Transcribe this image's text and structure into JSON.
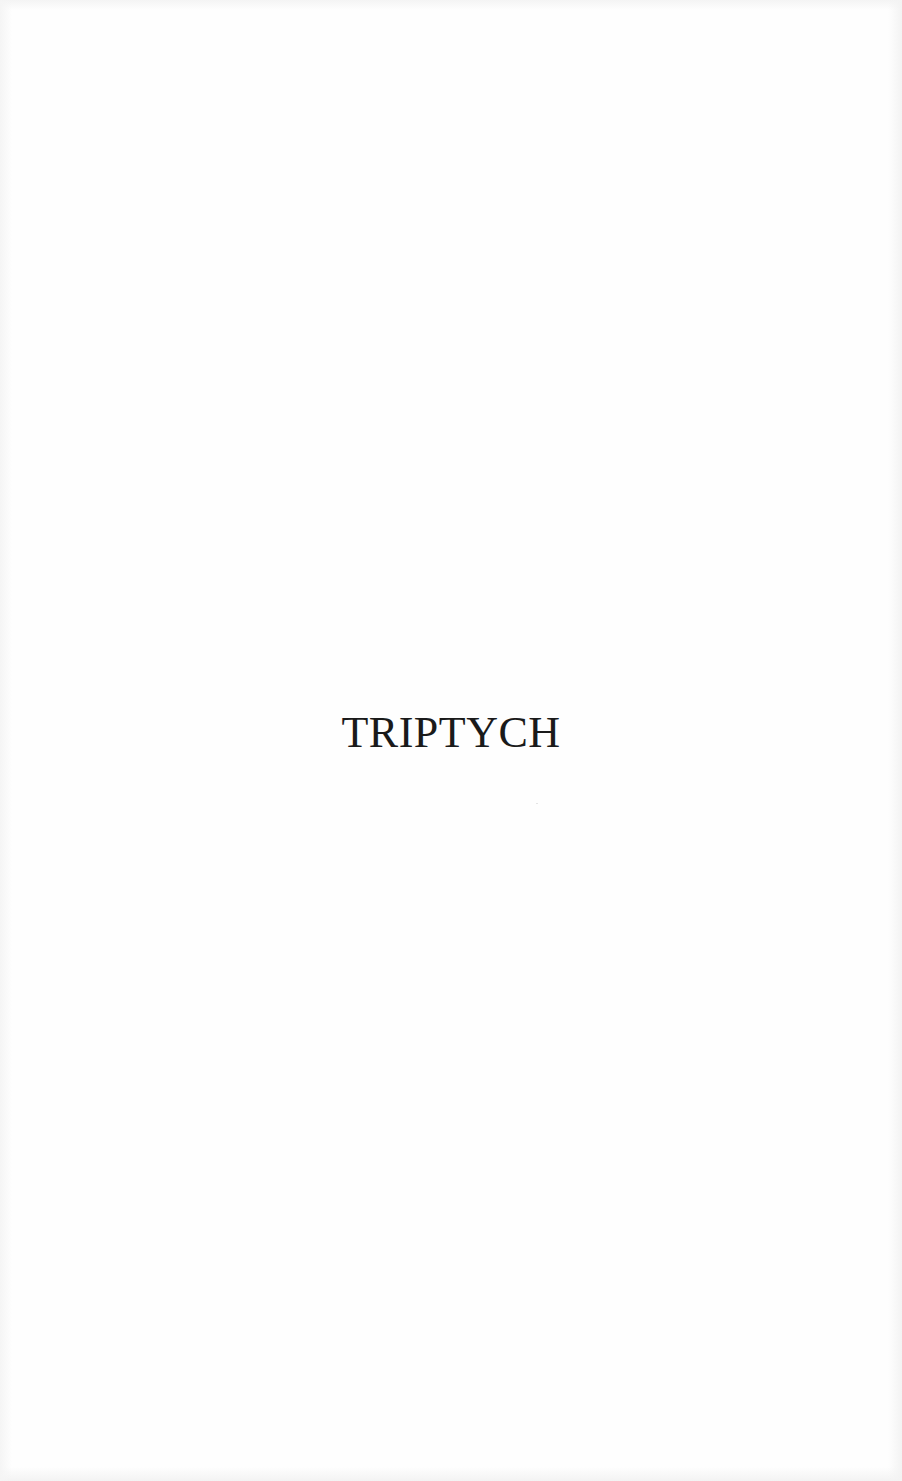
{
  "page": {
    "background_color": "#fefefe",
    "text_color": "#1a1a1a",
    "title": "TRIPTYCH"
  }
}
